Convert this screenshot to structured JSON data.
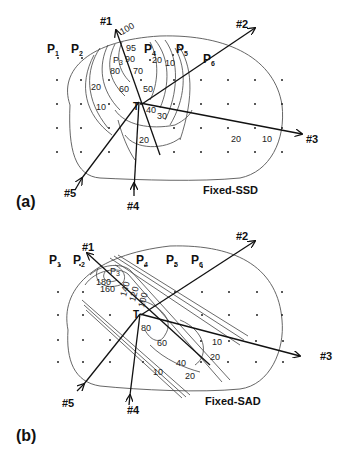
{
  "figure": {
    "panels": [
      {
        "id": "a",
        "panel_label": "(a)",
        "title": "Fixed-SSD",
        "points": [
          "P",
          "P",
          "P",
          "P",
          "P",
          "P"
        ],
        "point_subs": [
          "1",
          "2",
          "3",
          "4",
          "5",
          "6"
        ],
        "target_label": "T",
        "beams": [
          "#1",
          "#2",
          "#3",
          "#4",
          "#5"
        ],
        "isodose_labels": [
          "100",
          "95",
          "90",
          "80",
          "70",
          "60",
          "50",
          "40",
          "30",
          "20",
          "20",
          "10",
          "20",
          "10",
          "20",
          "10",
          "10"
        ]
      },
      {
        "id": "b",
        "panel_label": "(b)",
        "title": "Fixed-SAD",
        "points": [
          "P",
          "P",
          "P",
          "P",
          "P",
          "P"
        ],
        "point_subs": [
          "1",
          "2",
          "3",
          "4",
          "5",
          "6"
        ],
        "target_label": "T",
        "beams": [
          "#1",
          "#2",
          "#3",
          "#4",
          "#5"
        ],
        "isodose_labels": [
          "180",
          "160",
          "140",
          "120",
          "100",
          "80",
          "60",
          "40",
          "20",
          "10",
          "10",
          "20"
        ]
      }
    ]
  }
}
